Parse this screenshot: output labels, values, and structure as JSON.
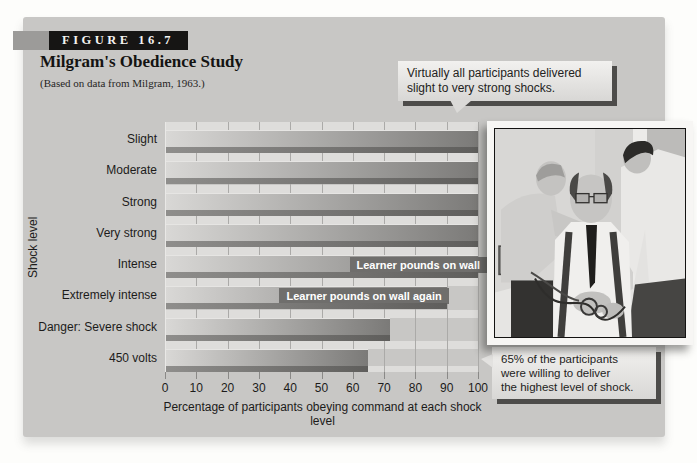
{
  "figure": {
    "tag": "FIGURE 16.7",
    "title": "Milgram's Obedience Study",
    "subtitle": "(Based on data from Milgram, 1963.)"
  },
  "chart_data": {
    "type": "bar",
    "orientation": "horizontal",
    "categories": [
      "Slight",
      "Moderate",
      "Strong",
      "Very strong",
      "Intense",
      "Extremely intense",
      "Danger: Severe shock",
      "450 volts"
    ],
    "values": [
      100,
      100,
      100,
      100,
      100,
      90,
      72,
      65
    ],
    "bar_labels": [
      null,
      null,
      null,
      null,
      "Learner pounds on wall",
      "Learner pounds on wall again",
      null,
      null
    ],
    "title": "Milgram's Obedience Study",
    "xlabel": "Percentage of participants obeying command at each shock level",
    "ylabel": "Shock level",
    "xlim": [
      0,
      100
    ],
    "xticks": [
      0,
      10,
      20,
      30,
      40,
      50,
      60,
      70,
      80,
      90,
      100
    ],
    "grid": true,
    "callouts": {
      "top": {
        "lines": [
          "Virtually all participants delivered",
          "slight to very strong shocks."
        ]
      },
      "bottom": {
        "lines": [
          "65% of the participants",
          "were willing to deliver",
          "the highest level of shock."
        ]
      }
    }
  },
  "photo": {
    "description": "Black-and-white photograph of the learner being strapped into the shock apparatus by two men"
  },
  "colors": {
    "panel_bg": "#c8c7c5",
    "bar_light": "#d9d8d6",
    "bar_dark": "#7b7a78",
    "tag_bg": "#161514",
    "callout_shadow": "#4d4c4a"
  }
}
